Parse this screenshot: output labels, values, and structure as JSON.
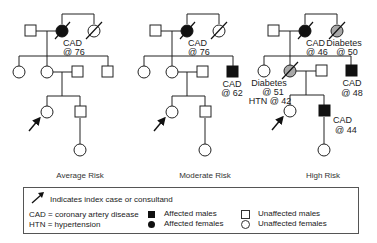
{
  "pedigrees": [
    {
      "id": "average",
      "caption": "Average Risk",
      "labels": {
        "grandmother": [
          "CAD",
          "@ 76"
        ]
      }
    },
    {
      "id": "moderate",
      "caption": "Moderate Risk",
      "labels": {
        "grandmother": [
          "CAD",
          "@ 76"
        ],
        "uncle": [
          "CAD",
          "@ 62"
        ]
      }
    },
    {
      "id": "high",
      "caption": "High Risk",
      "labels": {
        "grandmother": [
          "CAD",
          "@ 46"
        ],
        "great_aunt": [
          "Diabetes",
          "@ 50"
        ],
        "uncle": [
          "CAD",
          "@ 48"
        ],
        "mother": [
          "Diabetes",
          "@ 51",
          "HTN @ 42"
        ],
        "brother": [
          "CAD",
          "@ 44"
        ]
      }
    }
  ],
  "legend": {
    "index_case": "Indicates index case or consultand",
    "cad": "CAD = coronary artery disease",
    "htn": "HTN = hypertension",
    "affected_males": "Affected males",
    "affected_females": "Affected females",
    "unaffected_males": "Unaffected males",
    "unaffected_females": "Unaffected females"
  },
  "colors": {
    "affected": "#111111",
    "other_condition": "#a8a8a8",
    "line": "#222222"
  }
}
